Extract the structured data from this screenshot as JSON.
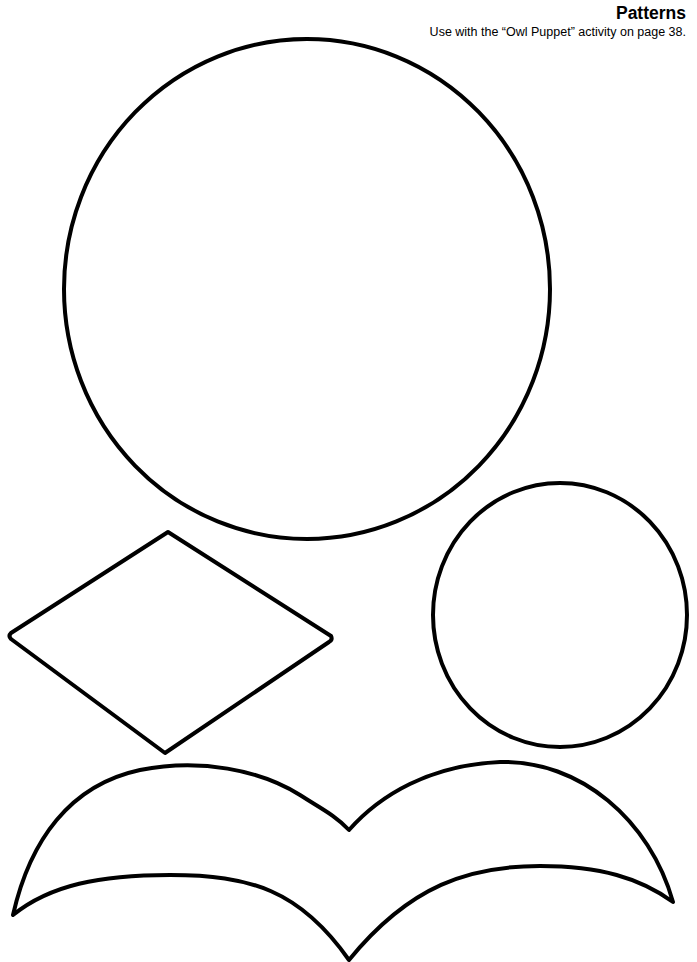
{
  "header": {
    "title": "Patterns",
    "subtitle": "Use with the “Owl Puppet” activity on page 38."
  },
  "shapes": [
    {
      "name": "large-circle",
      "description": "Owl body pattern"
    },
    {
      "name": "diamond",
      "description": "Owl beak pattern"
    },
    {
      "name": "small-circle",
      "description": "Owl eye pattern"
    },
    {
      "name": "wings",
      "description": "Owl wings pattern"
    }
  ],
  "colors": {
    "stroke": "#000000",
    "background": "#ffffff"
  }
}
